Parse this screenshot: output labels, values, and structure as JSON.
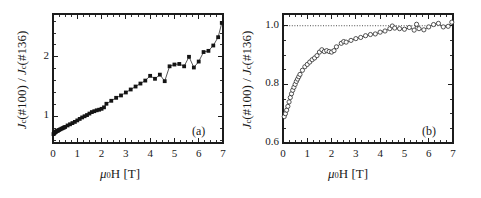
{
  "figure": {
    "background_color": "#ffffff",
    "marker_filled_color": "#141414",
    "marker_open_color": "#ffffff",
    "line_color": "#2b2b2b",
    "axis_color": "#1c1c1c"
  },
  "panels": [
    {
      "tag": "(a)",
      "xlabel_mu": "μ",
      "xlabel_sub": "0",
      "xlabel_rest": "H [T]",
      "ylabel_j1": "J",
      "ylabel_sub1": "c",
      "ylabel_mid1": "(#100) / ",
      "ylabel_j2": "J",
      "ylabel_sub2": "c",
      "ylabel_mid2": "(#136)",
      "xticks": [
        "0",
        "1",
        "2",
        "3",
        "4",
        "5",
        "6",
        "7"
      ],
      "yticks": [
        "1",
        "2"
      ]
    },
    {
      "tag": "(b)",
      "xlabel_mu": "μ",
      "xlabel_sub": "0",
      "xlabel_rest": "H [T]",
      "ylabel_j1": "J",
      "ylabel_sub1": "c",
      "ylabel_mid1": "(#100) / ",
      "ylabel_j2": "J",
      "ylabel_sub2": "c",
      "ylabel_mid2": "(#136)",
      "xticks": [
        "0",
        "1",
        "2",
        "3",
        "4",
        "5",
        "6",
        "7"
      ],
      "yticks": [
        "0.6",
        "0.8",
        "1.0"
      ]
    }
  ],
  "chart_data": [
    {
      "type": "scatter",
      "panel": "(a)",
      "title": "",
      "xlabel": "mu_0 H [T]",
      "ylabel": "J_c(#100) / J_c(#136)",
      "xlim": [
        0,
        7
      ],
      "ylim": [
        0.55,
        2.72
      ],
      "grid": false,
      "legend": null,
      "marker": "filled-square",
      "connected": true,
      "x": [
        0.02,
        0.04,
        0.06,
        0.08,
        0.1,
        0.12,
        0.15,
        0.18,
        0.21,
        0.25,
        0.3,
        0.35,
        0.4,
        0.45,
        0.5,
        0.6,
        0.7,
        0.8,
        0.9,
        1.0,
        1.1,
        1.2,
        1.3,
        1.4,
        1.5,
        1.6,
        1.7,
        1.8,
        1.9,
        2.0,
        2.1,
        2.2,
        2.4,
        2.6,
        2.8,
        3.0,
        3.2,
        3.4,
        3.6,
        3.8,
        4.0,
        4.2,
        4.4,
        4.6,
        4.8,
        5.0,
        5.2,
        5.4,
        5.6,
        5.8,
        6.0,
        6.2,
        6.4,
        6.6,
        6.8,
        6.95
      ],
      "y": [
        0.7,
        0.71,
        0.72,
        0.73,
        0.735,
        0.74,
        0.75,
        0.755,
        0.76,
        0.77,
        0.78,
        0.79,
        0.8,
        0.81,
        0.82,
        0.845,
        0.865,
        0.885,
        0.905,
        0.93,
        0.955,
        0.98,
        1.0,
        1.02,
        1.045,
        1.07,
        1.085,
        1.1,
        1.11,
        1.125,
        1.15,
        1.21,
        1.26,
        1.31,
        1.35,
        1.4,
        1.45,
        1.5,
        1.55,
        1.6,
        1.68,
        1.63,
        1.7,
        1.59,
        1.84,
        1.87,
        1.88,
        1.84,
        2.0,
        1.82,
        1.92,
        2.08,
        2.1,
        2.19,
        2.33,
        2.57
      ]
    },
    {
      "type": "scatter",
      "panel": "(b)",
      "title": "",
      "xlabel": "mu_0 H [T]",
      "ylabel": "J_c(#100) / J_c(#136)",
      "xlim": [
        0,
        7
      ],
      "ylim": [
        0.6,
        1.04
      ],
      "grid": false,
      "legend": null,
      "marker": "open-circle",
      "connected": true,
      "reference_line_y": 1.0,
      "x": [
        0.05,
        0.1,
        0.15,
        0.2,
        0.25,
        0.3,
        0.35,
        0.4,
        0.45,
        0.5,
        0.55,
        0.6,
        0.65,
        0.7,
        0.8,
        0.9,
        1.0,
        1.1,
        1.2,
        1.3,
        1.4,
        1.5,
        1.6,
        1.7,
        1.8,
        1.9,
        2.0,
        2.1,
        2.2,
        2.4,
        2.5,
        2.6,
        2.8,
        3.0,
        3.2,
        3.4,
        3.6,
        3.8,
        4.0,
        4.2,
        4.4,
        4.5,
        4.6,
        4.8,
        5.0,
        5.2,
        5.4,
        5.5,
        5.6,
        5.8,
        6.0,
        6.2,
        6.4,
        6.6,
        6.8,
        6.95
      ],
      "y": [
        0.69,
        0.7,
        0.712,
        0.725,
        0.74,
        0.755,
        0.768,
        0.78,
        0.79,
        0.8,
        0.81,
        0.818,
        0.826,
        0.834,
        0.848,
        0.86,
        0.868,
        0.876,
        0.884,
        0.89,
        0.898,
        0.91,
        0.918,
        0.912,
        0.915,
        0.912,
        0.91,
        0.915,
        0.928,
        0.94,
        0.946,
        0.944,
        0.95,
        0.956,
        0.96,
        0.966,
        0.97,
        0.972,
        0.978,
        0.982,
        0.99,
        0.999,
        0.992,
        0.99,
        0.988,
        0.994,
        0.985,
        1.005,
        0.99,
        0.986,
        0.996,
        1.004,
        1.008,
        0.996,
        0.998,
        1.012
      ]
    }
  ]
}
